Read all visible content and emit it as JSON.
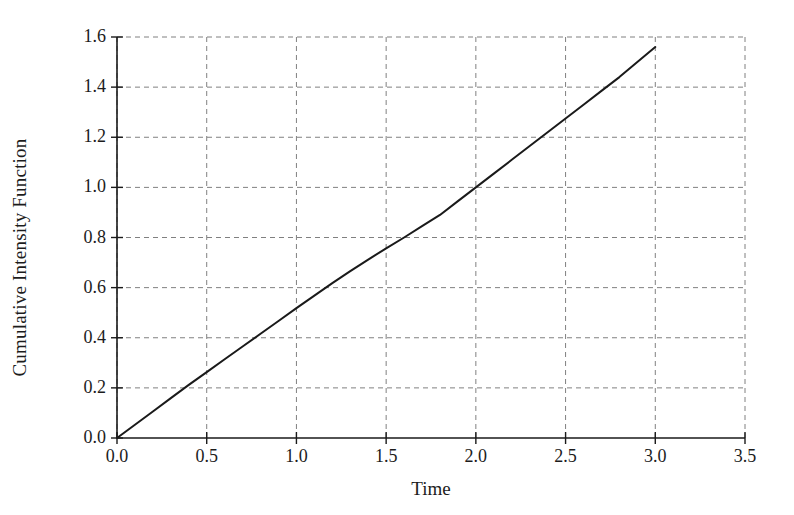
{
  "chart_data": {
    "type": "line",
    "title": "",
    "xlabel": "Time",
    "ylabel": "Cumulative Intensity Function",
    "xlim": [
      0.0,
      3.5
    ],
    "ylim": [
      0.0,
      1.6
    ],
    "xticks": [
      "0.0",
      "0.5",
      "1.0",
      "1.5",
      "2.0",
      "2.5",
      "3.0",
      "3.5"
    ],
    "xtick_values": [
      0.0,
      0.5,
      1.0,
      1.5,
      2.0,
      2.5,
      3.0,
      3.5
    ],
    "yticks": [
      "0.0",
      "0.2",
      "0.4",
      "0.6",
      "0.8",
      "1.0",
      "1.2",
      "1.4",
      "1.6"
    ],
    "ytick_values": [
      0.0,
      0.2,
      0.4,
      0.6,
      0.8,
      1.0,
      1.2,
      1.4,
      1.6
    ],
    "grid": true,
    "grid_style": "dashed",
    "grid_color": "#808080",
    "legend": null,
    "line_color": "#1a1a1a",
    "line_width": 2,
    "background": "#ffffff",
    "series": [
      {
        "name": "Cumulative Intensity Function",
        "x": [
          0.0,
          0.1,
          0.2,
          0.3,
          0.4,
          0.5,
          0.6,
          0.7,
          0.8,
          0.9,
          1.0,
          1.1,
          1.2,
          1.3,
          1.4,
          1.5,
          1.6,
          1.7,
          1.8,
          1.9,
          2.0,
          2.1,
          2.2,
          2.3,
          2.4,
          2.5,
          2.6,
          2.7,
          2.8,
          2.9,
          3.0
        ],
        "y": [
          0.0,
          0.053,
          0.106,
          0.159,
          0.212,
          0.263,
          0.314,
          0.365,
          0.416,
          0.467,
          0.518,
          0.568,
          0.618,
          0.666,
          0.712,
          0.757,
          0.8,
          0.845,
          0.89,
          0.945,
          1.0,
          1.055,
          1.11,
          1.165,
          1.22,
          1.275,
          1.33,
          1.385,
          1.44,
          1.5,
          1.56
        ]
      }
    ]
  },
  "axes": {
    "x_axis_name": "time-axis",
    "y_axis_name": "cumulative-intensity-axis"
  }
}
